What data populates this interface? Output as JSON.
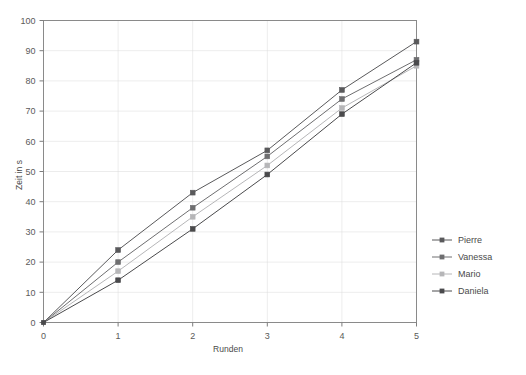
{
  "chart_data": {
    "type": "line",
    "title": "",
    "xlabel": "Runden",
    "ylabel": "Zeit in s",
    "x": [
      0,
      1,
      2,
      3,
      4,
      5
    ],
    "xlim": [
      0,
      5
    ],
    "ylim": [
      0,
      100
    ],
    "xticks": [
      "0",
      "1",
      "2",
      "3",
      "4",
      "5"
    ],
    "yticks": [
      "0",
      "10",
      "20",
      "30",
      "40",
      "50",
      "60",
      "70",
      "80",
      "90",
      "100"
    ],
    "grid": true,
    "legend_position": "right",
    "series": [
      {
        "name": "Pierre",
        "color": "#59595b",
        "values": [
          0,
          24,
          43,
          57,
          77,
          93
        ]
      },
      {
        "name": "Vanessa",
        "color": "#6e6e70",
        "values": [
          0,
          20,
          38,
          55,
          74,
          87
        ]
      },
      {
        "name": "Mario",
        "color": "#b6b6b8",
        "values": [
          0,
          17,
          35,
          52,
          71,
          85
        ]
      },
      {
        "name": "Daniela",
        "color": "#4a4a4c",
        "values": [
          0,
          14,
          31,
          49,
          69,
          86
        ]
      }
    ]
  },
  "axes": {
    "y_title": "Zeit in s",
    "x_title": "Runden"
  },
  "legend": {
    "entries": [
      {
        "label": "Pierre"
      },
      {
        "label": "Vanessa"
      },
      {
        "label": "Mario"
      },
      {
        "label": "Daniela"
      }
    ]
  },
  "colors": {
    "plot_border": "#8a8a8a",
    "grid": "#d9d9d9",
    "background": "#ffffff",
    "text": "#4a4a4a"
  }
}
